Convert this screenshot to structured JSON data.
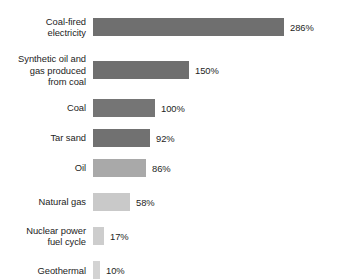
{
  "chart_data": {
    "type": "bar",
    "orientation": "horizontal",
    "title": "",
    "subtitle": "",
    "xlabel": "",
    "ylabel": "",
    "grid": false,
    "legend": null,
    "axis_visible": false,
    "value_suffix": "%",
    "xlim": [
      0,
      286
    ],
    "categories": [
      "Coal-fired\nelectricity",
      "Synthetic oil and\ngas produced\nfrom coal",
      "Coal",
      "Tar sand",
      "Oil",
      "Natural gas",
      "Nuclear power\nfuel cycle",
      "Geothermal"
    ],
    "values": [
      286,
      150,
      100,
      92,
      86,
      58,
      17,
      10
    ],
    "value_labels": [
      "286%",
      "150%",
      "100%",
      "92%",
      "86%",
      "58%",
      "17%",
      "10%"
    ],
    "bar_colors": [
      "#6f6f6f",
      "#6f6f6f",
      "#757575",
      "#717171",
      "#a9a9a9",
      "#c9c9c9",
      "#cdcdcd",
      "#d3d3d3"
    ],
    "bar_px_widths": [
      191,
      96,
      62,
      57,
      53,
      37,
      11,
      7
    ],
    "row_gaps_px": [
      15,
      12,
      12,
      12,
      16,
      14,
      14
    ]
  },
  "background_color": "#ffffff",
  "text_color": "#242424"
}
